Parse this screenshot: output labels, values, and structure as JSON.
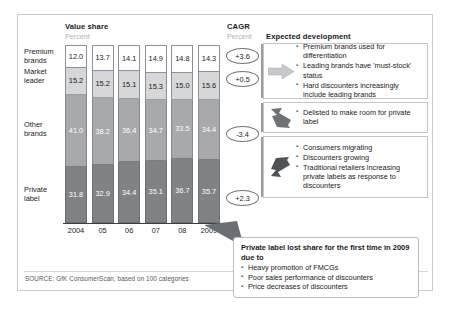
{
  "headers": {
    "value_share": "Value share",
    "value_share_unit": "Percent",
    "cagr": "CAGR",
    "cagr_unit": "Percent",
    "expected_development": "Expected development"
  },
  "row_labels": [
    "Premium\nbrands",
    "Market\nleader",
    "Other\nbrands",
    "Private\nlabel"
  ],
  "chart_data": {
    "type": "bar",
    "subtype": "stacked-100-percent",
    "title": "Value share",
    "ylabel": "Percent",
    "xlabel": "",
    "ylim": [
      0,
      100
    ],
    "grid": false,
    "legend": "row-labels-left",
    "categories": [
      "2004",
      "05",
      "06",
      "07",
      "08",
      "2009"
    ],
    "series": [
      {
        "name": "Premium brands",
        "values": [
          "12.0",
          "13.7",
          "14.1",
          "14.9",
          "14.8",
          "14.3"
        ],
        "cagr": "+3.6",
        "color": "#ffffff"
      },
      {
        "name": "Market leader",
        "values": [
          "15.2",
          "15.2",
          "15.1",
          "15.3",
          "15.0",
          "15.6"
        ],
        "cagr": "+0.5",
        "color": "#d6d7d9"
      },
      {
        "name": "Other brands",
        "values": [
          "41.0",
          "38.2",
          "36.4",
          "34.7",
          "33.5",
          "34.4"
        ],
        "cagr": "-3.4",
        "color": "#a7a9ac"
      },
      {
        "name": "Private label",
        "values": [
          "31.8",
          "32.9",
          "34.4",
          "35.1",
          "36.7",
          "35.7"
        ],
        "cagr": "+2.3",
        "color": "#808386"
      }
    ]
  },
  "panels": [
    {
      "arrow": "arrow-right-icon",
      "bullets": [
        "Premium brands used for differentiation",
        "Leading brands have 'must-stock' status",
        "Hard discounters increasingly include leading brands"
      ]
    },
    {
      "arrow": "arrow-down-right-icon",
      "bullets": [
        "Delisted to make room for private label"
      ]
    },
    {
      "arrow": "arrow-up-right-icon",
      "bullets": [
        "Consumers migrating",
        "Discounters growing",
        "Traditional retailers increasing private labels as response to discounters"
      ]
    }
  ],
  "callout": {
    "title": "Private label lost share for the first time in 2009 due to",
    "bullets": [
      "Heavy promotion of FMCGs",
      "Poor sales performance of discounters",
      "Price decreases of discounters"
    ]
  },
  "source": "SOURCE: GfK ConsumerScan, based on 100 categories"
}
